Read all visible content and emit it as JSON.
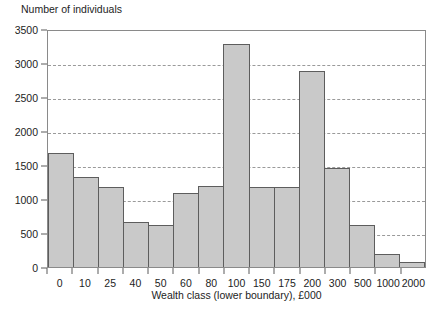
{
  "chart_data": {
    "type": "bar",
    "title": "",
    "xlabel": "Wealth class (lower boundary), £000",
    "ylabel": "Number of individuals",
    "categories": [
      "0",
      "10",
      "25",
      "40",
      "50",
      "60",
      "80",
      "100",
      "150",
      "175",
      "200",
      "300",
      "500",
      "1000",
      "2000"
    ],
    "values": [
      1670,
      1320,
      1175,
      665,
      625,
      1090,
      1190,
      3280,
      1180,
      1180,
      2885,
      1455,
      625,
      190,
      70
    ],
    "ylim": [
      0,
      3500
    ],
    "ytick_labels": [
      "0",
      "500",
      "1000",
      "1500",
      "2000",
      "2500",
      "3000",
      "3500"
    ],
    "ytick_values": [
      0,
      500,
      1000,
      1500,
      2000,
      2500,
      3000,
      3500
    ],
    "grid": "horizontal-dashed",
    "grid_values": [
      500,
      1000,
      1500,
      2000,
      2500,
      3000
    ],
    "legend": "none",
    "bar_fill_color": "#c9c9c9",
    "bar_edge_color": "#5d5d5d",
    "axis_color": "#8a8a8a",
    "gridline_color": "#9a9a9a"
  }
}
